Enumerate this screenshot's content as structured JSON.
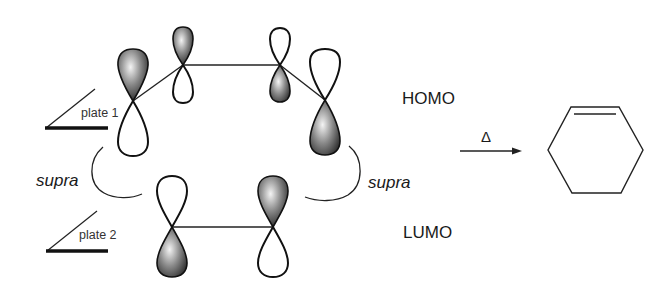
{
  "figure": {
    "labels": {
      "homo": "HOMO",
      "lumo": "LUMO",
      "plate1": "plate 1",
      "plate2": "plate 2",
      "supra_left": "supra",
      "supra_right": "supra",
      "heat": "Δ"
    },
    "homo_component": {
      "name": "diene",
      "orbitals": [
        {
          "position": 1,
          "top_lobe": "shaded",
          "bottom_lobe": "open"
        },
        {
          "position": 2,
          "top_lobe": "shaded",
          "bottom_lobe": "open"
        },
        {
          "position": 3,
          "top_lobe": "open",
          "bottom_lobe": "shaded"
        },
        {
          "position": 4,
          "top_lobe": "open",
          "bottom_lobe": "shaded"
        }
      ]
    },
    "lumo_component": {
      "name": "dienophile",
      "orbitals": [
        {
          "position": 1,
          "top_lobe": "open",
          "bottom_lobe": "shaded"
        },
        {
          "position": 2,
          "top_lobe": "shaded",
          "bottom_lobe": "open"
        }
      ]
    },
    "product": {
      "name": "cyclohexene",
      "shape": "hexagon",
      "double_bond": "top edge"
    },
    "colors": {
      "line": "#222222",
      "shade_dark": "#1a1a1a",
      "shade_light": "#f2f2f2",
      "background": "#ffffff"
    }
  }
}
